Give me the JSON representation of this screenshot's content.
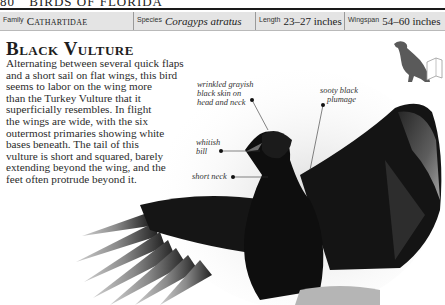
{
  "running_head": {
    "page_number": "80",
    "section": "BIRDS OF FLORIDA"
  },
  "info_bar": {
    "family_label": "Family",
    "family_value": "Cathartidae",
    "species_label": "Species",
    "species_value": "Coragyps atratus",
    "length_label": "Length",
    "length_value": "23–27 inches",
    "wingspan_label": "Wingspan",
    "wingspan_value": "54–60 inches"
  },
  "title": "Black Vulture",
  "body_lines": [
    "Alternating between several quick flaps",
    "and a short sail on flat wings, this bird",
    "seems to labor on the wing more",
    "than the Turkey Vulture that it",
    "superficially resembles. In flight",
    "the wings are wide, with the six",
    "outermost primaries showing white",
    "bases beneath. The tail of this",
    "vulture is short and squared, barely",
    "extending beyond the wing, and the",
    "feet often protrude beyond it."
  ],
  "annotations": {
    "skin": [
      "wrinkled grayish",
      "black skin on",
      "head and neck"
    ],
    "plumage": [
      "sooty black",
      "plumage"
    ],
    "bill": [
      "whitish",
      "bill"
    ],
    "neck": [
      "short neck"
    ]
  },
  "images": {
    "photo": "black-vulture-wings-spread-photo",
    "silhouette": "perched-vulture-silhouette-icon"
  },
  "colors": {
    "info_bar_bg": "#e4e4e4",
    "silhouette": "#5a5a5a",
    "bird": "#111111"
  }
}
